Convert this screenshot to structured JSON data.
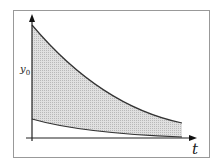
{
  "diagram": {
    "y_label": "y",
    "y_label_sub": "0",
    "x_label": "t",
    "fill_color": "#d4d4d4",
    "line_color": "#222222",
    "frame_color": "#999999"
  }
}
